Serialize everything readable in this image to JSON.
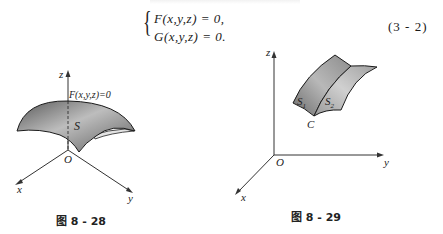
{
  "equation": {
    "line1": "F(x,y,z) = 0,",
    "line2": "G(x,y,z) = 0.",
    "number": "(3 - 2)"
  },
  "figure_left": {
    "caption": "图 8 - 28",
    "surface_label": "S",
    "equation_label": "F(x,y,z)=0",
    "axes": {
      "z": "z",
      "x": "x",
      "y": "y",
      "origin": "O"
    },
    "colors": {
      "surface_dark": "#6a6a6a",
      "surface_light": "#d9d9d9",
      "axis": "#333333"
    }
  },
  "figure_right": {
    "caption": "图 8 - 29",
    "surface1_label": "S",
    "surface1_sub": "1",
    "surface2_label": "S",
    "surface2_sub": "2",
    "curve_label": "C",
    "axes": {
      "z": "z",
      "x": "x",
      "y": "y",
      "origin": "O"
    }
  }
}
